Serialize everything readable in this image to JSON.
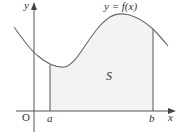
{
  "diagram": {
    "type": "area-under-curve",
    "curve_label": "y = f(x)",
    "region_label": "S",
    "axis_labels": {
      "x": "x",
      "y": "y",
      "origin": "O"
    },
    "bounds": {
      "lower": "a",
      "upper": "b"
    },
    "colors": {
      "curve": "#6a6a6a",
      "axes": "#555555",
      "fill": "#f3f3f3",
      "bound_lines": "#555555",
      "text": "#333333"
    }
  }
}
